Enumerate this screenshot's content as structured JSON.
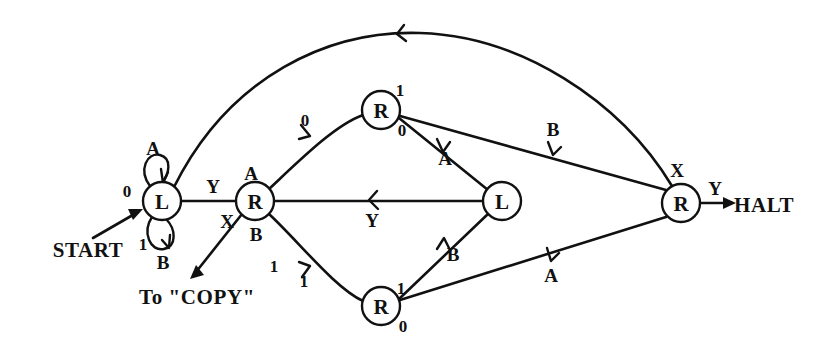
{
  "figure": {
    "type": "state-transition-diagram",
    "title": "",
    "background_color": "#ffffff",
    "ink_color": "#111111"
  },
  "nodes": [
    {
      "id": "L-left",
      "label": "L",
      "cx": 162,
      "cy": 201,
      "r": 19
    },
    {
      "id": "R-left",
      "label": "R",
      "cx": 255,
      "cy": 201,
      "r": 19
    },
    {
      "id": "R-top",
      "label": "R",
      "cx": 381,
      "cy": 110,
      "r": 19
    },
    {
      "id": "R-bottom",
      "label": "R",
      "cx": 381,
      "cy": 306,
      "r": 19
    },
    {
      "id": "L-mid",
      "label": "L",
      "cx": 502,
      "cy": 201,
      "r": 19
    },
    {
      "id": "R-right",
      "label": "R",
      "cx": 681,
      "cy": 203,
      "r": 19
    }
  ],
  "terminals": [
    {
      "id": "start",
      "label": "START",
      "x": 88,
      "y": 250
    },
    {
      "id": "halt",
      "label": "HALT",
      "x": 764,
      "y": 205
    },
    {
      "id": "copy",
      "label": "To \"COPY\"",
      "x": 197,
      "y": 297
    }
  ],
  "self_loops": [
    {
      "node": "L-left",
      "position": "top",
      "symbol": "A",
      "bit": "0"
    },
    {
      "node": "L-left",
      "position": "bottom",
      "symbol": "B",
      "bit": "1"
    }
  ],
  "edge_labels": {
    "start_bit": "0",
    "loop_top_symbol": "A",
    "loop_top_bit": "0",
    "loop_bottom_symbol": "B",
    "loop_bottom_bit": "1",
    "rleft_upper_left": "Y",
    "rleft_lower_left": "X",
    "rleft_upper_right": "A",
    "rleft_lower_right": "B",
    "diag_up_bit": "0",
    "diag_down_bit": "1",
    "copy_branch_bit": "1",
    "rtop_upper_bit": "1",
    "rtop_lower_bit": "0",
    "rbottom_upper_bit": "1",
    "rbottom_lower_bit": "0",
    "rtop_to_lmid": "A",
    "rtop_to_rright": "B",
    "lmid_to_rbottom": "B",
    "rbottom_to_rright": "A",
    "lmid_to_rleft": "Y",
    "rright_top": "X",
    "rright_to_halt": "Y"
  },
  "transitions": [
    {
      "from": "START",
      "to": "L-left",
      "read": "0",
      "write": ""
    },
    {
      "from": "L-left",
      "to": "L-left",
      "read": "0",
      "write": "A"
    },
    {
      "from": "L-left",
      "to": "L-left",
      "read": "1",
      "write": "B"
    },
    {
      "from": "L-left",
      "to": "R-right",
      "read": "",
      "write": ""
    },
    {
      "from": "R-left",
      "to": "R-top",
      "read": "0",
      "write": ""
    },
    {
      "from": "R-left",
      "to": "R-bottom",
      "read": "1",
      "write": ""
    },
    {
      "from": "R-left",
      "to": "COPY",
      "read": "1",
      "write": ""
    },
    {
      "from": "R-top",
      "to": "L-mid",
      "read": "0",
      "write": "A"
    },
    {
      "from": "R-top",
      "to": "R-right",
      "read": "1",
      "write": "B"
    },
    {
      "from": "L-mid",
      "to": "R-bottom",
      "read": "",
      "write": "B"
    },
    {
      "from": "R-bottom",
      "to": "R-right",
      "read": "1",
      "write": "A"
    },
    {
      "from": "L-mid",
      "to": "R-left",
      "read": "",
      "write": "Y"
    },
    {
      "from": "R-right",
      "to": "HALT",
      "read": "Y",
      "write": ""
    }
  ]
}
